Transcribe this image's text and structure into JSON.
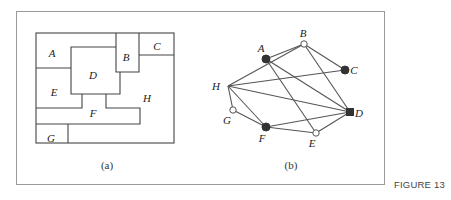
{
  "figure_label": "FIGURE 13",
  "panel_a": {
    "caption": "(a)",
    "regions": [
      {
        "id": "A",
        "label": "A",
        "x": 52,
        "y": 53
      },
      {
        "id": "B",
        "label": "B",
        "x": 126,
        "y": 57
      },
      {
        "id": "C",
        "label": "C",
        "x": 157,
        "y": 46
      },
      {
        "id": "D",
        "label": "D",
        "x": 93,
        "y": 75
      },
      {
        "id": "E",
        "label": "E",
        "x": 54,
        "y": 92
      },
      {
        "id": "F",
        "label": "F",
        "x": 93,
        "y": 113
      },
      {
        "id": "G",
        "label": "G",
        "x": 51,
        "y": 138
      },
      {
        "id": "H",
        "label": "H",
        "x": 147,
        "y": 98
      }
    ]
  },
  "panel_b": {
    "caption": "(b)",
    "nodes": [
      {
        "id": "A",
        "label": "A",
        "x": 266,
        "y": 59,
        "marker": "filled-circle",
        "lx": 261,
        "ly": 52
      },
      {
        "id": "B",
        "label": "B",
        "x": 304,
        "y": 44,
        "marker": "hollow-circle",
        "lx": 303,
        "ly": 37
      },
      {
        "id": "C",
        "label": "C",
        "x": 345,
        "y": 70,
        "marker": "filled-circle",
        "lx": 354,
        "ly": 74
      },
      {
        "id": "D",
        "label": "D",
        "x": 350,
        "y": 112,
        "marker": "filled-square",
        "lx": 359,
        "ly": 117
      },
      {
        "id": "E",
        "label": "E",
        "x": 316,
        "y": 133,
        "marker": "hollow-circle",
        "lx": 312,
        "ly": 147
      },
      {
        "id": "F",
        "label": "F",
        "x": 266,
        "y": 127,
        "marker": "filled-circle",
        "lx": 262,
        "ly": 142
      },
      {
        "id": "G",
        "label": "G",
        "x": 233,
        "y": 110,
        "marker": "hollow-circle",
        "lx": 227,
        "ly": 124
      },
      {
        "id": "H",
        "label": "H",
        "x": 228,
        "y": 86,
        "marker": "none",
        "lx": 216,
        "ly": 90
      }
    ],
    "edges": [
      [
        "A",
        "B"
      ],
      [
        "A",
        "D"
      ],
      [
        "A",
        "E"
      ],
      [
        "B",
        "C"
      ],
      [
        "B",
        "D"
      ],
      [
        "B",
        "H"
      ],
      [
        "C",
        "H"
      ],
      [
        "D",
        "H"
      ],
      [
        "D",
        "F"
      ],
      [
        "D",
        "E"
      ],
      [
        "E",
        "F"
      ],
      [
        "F",
        "H"
      ],
      [
        "F",
        "G"
      ],
      [
        "G",
        "H"
      ]
    ]
  }
}
